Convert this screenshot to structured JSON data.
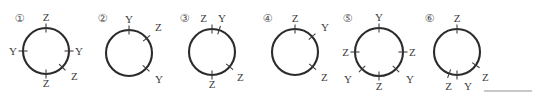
{
  "page": {
    "width": 536,
    "height": 103,
    "background": "#ffffff",
    "stroke_color": "#2b2b2b",
    "label_color": "#3a3a3a",
    "rule_color": "#c9c9c9"
  },
  "figures": [
    {
      "number": "①",
      "num_x": 13,
      "num_y": 12,
      "cx": 46,
      "cy": 51,
      "r": 23,
      "marks": [
        {
          "angle": 90,
          "label": "Z",
          "lx": 46,
          "ly": 21,
          "anchor": "middle"
        },
        {
          "angle": 180,
          "label": "Y",
          "lx": 17,
          "ly": 55,
          "anchor": "end"
        },
        {
          "angle": 0,
          "label": "Y",
          "lx": 75,
          "ly": 55,
          "anchor": "start"
        },
        {
          "angle": 270,
          "label": "Z",
          "lx": 46,
          "ly": 87,
          "anchor": "middle"
        },
        {
          "angle": 315,
          "label": "Z",
          "lx": 71,
          "ly": 80,
          "anchor": "start"
        }
      ]
    },
    {
      "number": "②",
      "num_x": 96,
      "num_y": 12,
      "cx": 129,
      "cy": 53,
      "r": 23,
      "marks": [
        {
          "angle": 90,
          "label": "Y",
          "lx": 129,
          "ly": 23,
          "anchor": "middle"
        },
        {
          "angle": 40,
          "label": "Z",
          "lx": 155,
          "ly": 31,
          "anchor": "start"
        },
        {
          "angle": 318,
          "label": "Y",
          "lx": 155,
          "ly": 83,
          "anchor": "start"
        }
      ]
    },
    {
      "number": "③",
      "num_x": 178,
      "num_y": 12,
      "cx": 212,
      "cy": 52,
      "r": 23,
      "marks": [
        {
          "angle": 90,
          "label": "Z",
          "lx": 207,
          "ly": 22,
          "anchor": "end"
        },
        {
          "angle": 72,
          "label": "Y",
          "lx": 218,
          "ly": 22,
          "anchor": "start"
        },
        {
          "angle": 320,
          "label": "Z",
          "lx": 237,
          "ly": 81,
          "anchor": "start"
        },
        {
          "angle": 270,
          "label": "Z",
          "lx": 212,
          "ly": 88,
          "anchor": "middle"
        }
      ]
    },
    {
      "number": "④",
      "num_x": 261,
      "num_y": 12,
      "cx": 295,
      "cy": 52,
      "r": 23,
      "marks": [
        {
          "angle": 90,
          "label": "Z",
          "lx": 295,
          "ly": 22,
          "anchor": "middle"
        },
        {
          "angle": 42,
          "label": "Y",
          "lx": 321,
          "ly": 31,
          "anchor": "start"
        },
        {
          "angle": 320,
          "label": "Z",
          "lx": 321,
          "ly": 81,
          "anchor": "start"
        }
      ]
    },
    {
      "number": "⑤",
      "num_x": 341,
      "num_y": 12,
      "cx": 379,
      "cy": 52,
      "r": 24,
      "marks": [
        {
          "angle": 90,
          "label": "Y",
          "lx": 379,
          "ly": 21,
          "anchor": "middle"
        },
        {
          "angle": 180,
          "label": "Z",
          "lx": 349,
          "ly": 56,
          "anchor": "end"
        },
        {
          "angle": 0,
          "label": "Z",
          "lx": 409,
          "ly": 56,
          "anchor": "start"
        },
        {
          "angle": 225,
          "label": "Y",
          "lx": 352,
          "ly": 83,
          "anchor": "end"
        },
        {
          "angle": 315,
          "label": "Y",
          "lx": 406,
          "ly": 83,
          "anchor": "start"
        },
        {
          "angle": 270,
          "label": "Z",
          "lx": 379,
          "ly": 90,
          "anchor": "middle"
        }
      ]
    },
    {
      "number": "⑥",
      "num_x": 423,
      "num_y": 12,
      "cx": 457,
      "cy": 52,
      "r": 23,
      "marks": [
        {
          "angle": 90,
          "label": "Z",
          "lx": 457,
          "ly": 22,
          "anchor": "middle"
        },
        {
          "angle": 270,
          "label": "Z",
          "lx": 452,
          "ly": 90,
          "anchor": "end"
        },
        {
          "angle": 250,
          "label": "Y",
          "lx": 464,
          "ly": 90,
          "anchor": "start"
        },
        {
          "angle": 325,
          "label": "Z",
          "lx": 482,
          "ly": 81,
          "anchor": "start"
        }
      ]
    }
  ],
  "rule": {
    "x": 484,
    "y": 90,
    "width": 48
  }
}
